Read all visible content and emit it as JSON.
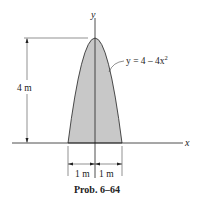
{
  "figure": {
    "caption": "Prob. 6–64",
    "axis_x_label": "x",
    "axis_y_label": "y",
    "curve_label": "y = 4 – 4x",
    "curve_exponent": "2",
    "height_dim_label": "4 m",
    "left_width_label": "1 m",
    "right_width_label": "1 m",
    "fill_color": "#c8c8c8",
    "stroke_color": "#222222"
  }
}
